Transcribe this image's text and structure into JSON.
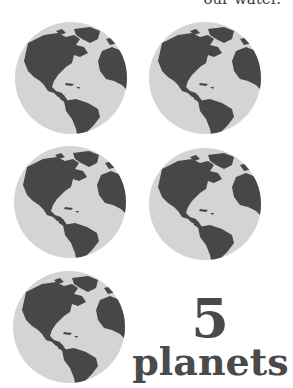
{
  "header": {
    "partial_text": "our water."
  },
  "globes": {
    "count": 5,
    "ocean_color": "#d4d4d4",
    "land_color": "#474747"
  },
  "caption": {
    "number": "5",
    "label": "planets"
  }
}
